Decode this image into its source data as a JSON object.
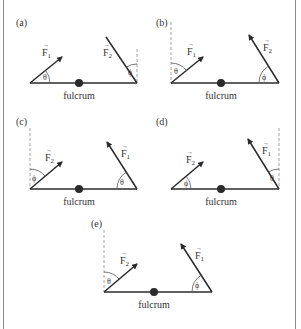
{
  "figure": {
    "fulcrum_label": "fulcrum",
    "colors": {
      "line": "#2b2b2b",
      "dashed": "#9a9a9a",
      "text": "#333333",
      "border": "#8a8a8a"
    },
    "panels": [
      {
        "id": "a",
        "label": "(a)",
        "left_force": "F1",
        "left_angle": "θ",
        "left_angle_ref": "lever",
        "right_force": "F2",
        "right_angle": "ϕ",
        "right_angle_ref": "vertical"
      },
      {
        "id": "b",
        "label": "(b)",
        "left_force": "F1",
        "left_angle": "θ",
        "left_angle_ref": "vertical",
        "right_force": "F2",
        "right_angle": "ϕ",
        "right_angle_ref": "lever"
      },
      {
        "id": "c",
        "label": "(c)",
        "left_force": "F2",
        "left_angle": "ϕ",
        "left_angle_ref": "vertical",
        "right_force": "F1",
        "right_angle": "θ",
        "right_angle_ref": "lever"
      },
      {
        "id": "d",
        "label": "(d)",
        "left_force": "F2",
        "left_angle": "ϕ",
        "left_angle_ref": "lever",
        "right_force": "F1",
        "right_angle": "θ",
        "right_angle_ref": "vertical"
      },
      {
        "id": "e",
        "label": "(e)",
        "left_force": "F2",
        "left_angle": "θ",
        "left_angle_ref": "vertical",
        "right_force": "F1",
        "right_angle": "ϕ",
        "right_angle_ref": "lever"
      }
    ]
  },
  "labels": {
    "a": "(a)",
    "b": "(b)",
    "c": "(c)",
    "d": "(d)",
    "e": "(e)",
    "F1": "F",
    "F2": "F",
    "sub1": "1",
    "sub2": "2",
    "vec": "→",
    "theta": "θ",
    "phi": "ϕ",
    "fulcrum": "fulcrum"
  }
}
